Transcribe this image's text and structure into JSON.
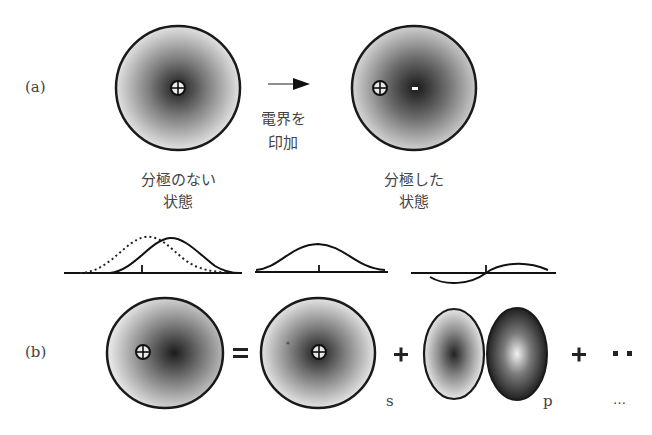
{
  "panel_a": {
    "label": "(a)",
    "arrow_caption_line1": "電界を",
    "arrow_caption_line2": "印加",
    "left_caption_line1": "分極のない",
    "left_caption_line2": "状態",
    "right_caption_line1": "分極した",
    "right_caption_line2": "状態",
    "nucleus_symbol": "⊕",
    "electron_symbol": "-"
  },
  "panel_b": {
    "label": "(b)",
    "equals": "=",
    "plus1": "+",
    "plus2": "+",
    "dots": "▪▪",
    "s_label": "s",
    "p_label": "p",
    "ellipsis_label": "…"
  },
  "colors": {
    "stroke": "#1a1a1a",
    "shade_dark": "#222222",
    "shade_light": "#e6e6e6"
  }
}
